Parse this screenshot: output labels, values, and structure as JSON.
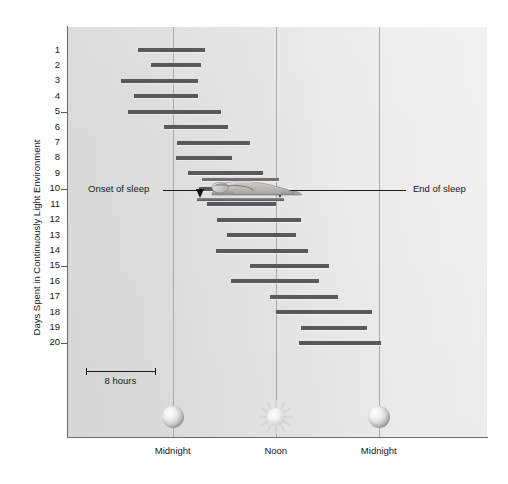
{
  "chart_data": {
    "type": "bar",
    "title": "",
    "subtitle": "",
    "xlabel": "",
    "ylabel": "Days Spent in Continuously Light Environment",
    "x_axis": {
      "type": "time-of-day",
      "unit": "hours",
      "range_hours": [
        -12.2,
        36.6
      ],
      "tick_labels": [
        "Midnight",
        "Noon",
        "Midnight"
      ],
      "tick_hours": [
        0,
        12,
        24
      ],
      "grid": true,
      "gridline_count": 3
    },
    "y_axis": {
      "label": "Days Spent in Continuously Light Environment",
      "tick_labels": [
        "1",
        "2",
        "3",
        "4",
        "5",
        "6",
        "7",
        "8",
        "9",
        "10",
        "11",
        "12",
        "13",
        "14",
        "15",
        "16",
        "17",
        "18",
        "19",
        "20"
      ],
      "major_ticks": [
        5,
        10,
        15,
        20
      ],
      "range": [
        1,
        20
      ],
      "direction": "top-to-bottom",
      "grid": false
    },
    "series": [
      {
        "name": "Sleep episode",
        "color": "#59595b",
        "unit": "hours from midnight",
        "bars": [
          {
            "day": 1,
            "start": -4.0,
            "end": 3.8
          },
          {
            "day": 2,
            "start": -2.5,
            "end": 3.3
          },
          {
            "day": 3,
            "start": -6.0,
            "end": 3.0
          },
          {
            "day": 4,
            "start": -4.5,
            "end": 2.9
          },
          {
            "day": 5,
            "start": -5.2,
            "end": 5.6
          },
          {
            "day": 6,
            "start": -1.0,
            "end": 6.4
          },
          {
            "day": 7,
            "start": 0.5,
            "end": 9.0
          },
          {
            "day": 8,
            "start": 0.4,
            "end": 6.9
          },
          {
            "day": 9,
            "start": 1.8,
            "end": 10.5
          },
          {
            "day": 10,
            "start": 3.0,
            "end": 12.4
          },
          {
            "day": 11,
            "start": 4.0,
            "end": 12.0
          },
          {
            "day": 12,
            "start": 5.2,
            "end": 15.0
          },
          {
            "day": 13,
            "start": 6.3,
            "end": 14.4
          },
          {
            "day": 14,
            "start": 5.0,
            "end": 15.8
          },
          {
            "day": 15,
            "start": 9.0,
            "end": 18.2
          },
          {
            "day": 16,
            "start": 6.8,
            "end": 17.0
          },
          {
            "day": 17,
            "start": 11.3,
            "end": 19.2
          },
          {
            "day": 18,
            "start": 12.0,
            "end": 23.2
          },
          {
            "day": 19,
            "start": 14.9,
            "end": 22.6
          },
          {
            "day": 20,
            "start": 14.7,
            "end": 24.3
          }
        ]
      }
    ],
    "annotations": [
      {
        "name": "onset-of-sleep",
        "label": "Onset of sleep",
        "day": 10,
        "points_to_hours": 3.2
      },
      {
        "name": "end-of-sleep",
        "label": "End of sleep",
        "day": 10,
        "points_to_hours": 12.6
      }
    ],
    "scale_bar": {
      "label": "8 hours",
      "length_hours": 8
    },
    "icons": [
      {
        "name": "moon-icon",
        "at_label": "Midnight",
        "hour": 0
      },
      {
        "name": "sun-icon",
        "at_label": "Noon",
        "hour": 12
      },
      {
        "name": "moon-icon",
        "at_label": "Midnight",
        "hour": 24
      }
    ],
    "colors": {
      "bar": "#59595b",
      "plot_background_left": "#d9d9d9",
      "plot_background_right": "#f0f0f0",
      "gridline": "#a9a9a9",
      "axis": "#6a6a6a",
      "text": "#16181a"
    }
  },
  "figure": {
    "y_axis_title": "Days Spent in Continuously Light Environment",
    "x_tick_labels": [
      "Midnight",
      "Noon",
      "Midnight"
    ],
    "y_tick_labels": [
      "1",
      "2",
      "3",
      "4",
      "5",
      "6",
      "7",
      "8",
      "9",
      "10",
      "11",
      "12",
      "13",
      "14",
      "15",
      "16",
      "17",
      "18",
      "19",
      "20"
    ],
    "annotation_left": "Onset of sleep",
    "annotation_right": "End of sleep",
    "scale_label": "8 hours"
  }
}
